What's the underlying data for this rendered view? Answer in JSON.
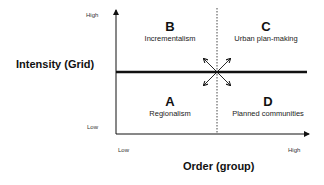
{
  "diagram": {
    "type": "quadrant",
    "y_axis": {
      "title": "Intensity (Grid)",
      "high_label": "High",
      "low_label": "Low"
    },
    "x_axis": {
      "title": "Order (group)",
      "low_label": "Low",
      "high_label": "High"
    },
    "quadrants": [
      {
        "letter": "B",
        "label": "Incrementalism",
        "position": "top-left"
      },
      {
        "letter": "C",
        "label": "Urban plan-making",
        "position": "top-right"
      },
      {
        "letter": "A",
        "label": "Regionalism",
        "position": "bottom-left"
      },
      {
        "letter": "D",
        "label": "Planned communities",
        "position": "bottom-right"
      }
    ],
    "center_symbol": "four-way-diagonal-arrows",
    "colors": {
      "line": "#111111",
      "background": "#ffffff"
    }
  }
}
